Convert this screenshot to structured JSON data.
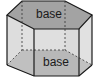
{
  "diagram": {
    "labels": {
      "top_base": "base",
      "bottom_base": "base"
    },
    "colors": {
      "base_face": "#a3a3a3",
      "side_face_light": "#e6e6e6",
      "side_face_mid": "#d2d2d2",
      "edge": "#1a1a1a",
      "hidden_edge": "#333333"
    }
  }
}
